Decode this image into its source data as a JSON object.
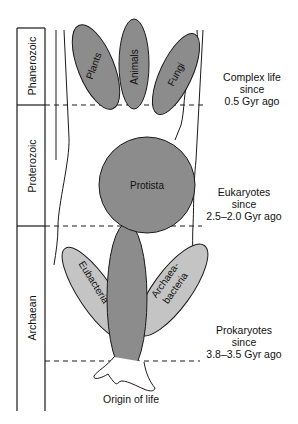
{
  "diagram": {
    "eons": [
      {
        "name": "Phanerozoic"
      },
      {
        "name": "Proterozoic"
      },
      {
        "name": "Archaean"
      }
    ],
    "groups": {
      "plants": "Plants",
      "animals": "Animals",
      "fungi": "Fungi",
      "protista": "Protista",
      "eubacteria": "Eubacteria",
      "archaea_line1": "Archaea-",
      "archaea_line2": "bacteria"
    },
    "annotations": [
      {
        "line1": "Complex life",
        "line2": "since",
        "line3": "0.5 Gyr ago"
      },
      {
        "line1": "Eukaryotes",
        "line2": "since",
        "line3": "2.5–2.0 Gyr ago"
      },
      {
        "line1": "Prokaryotes",
        "line2": "since",
        "line3": "3.8–3.5 Gyr ago"
      }
    ],
    "origin_label": "Origin of life",
    "colors": {
      "dark_fill": "#8c8c8c",
      "light_fill": "#c4c4c4",
      "stroke": "#1a1a1a"
    }
  }
}
